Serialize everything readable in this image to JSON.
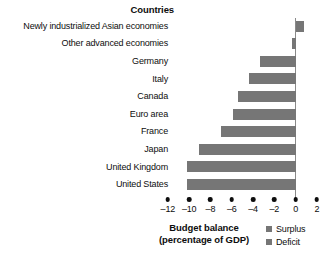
{
  "heading": "Countries",
  "axis_title_line1": "Budget balance",
  "axis_title_line2": "(percentage of GDP)",
  "legend": [
    {
      "label": "Surplus",
      "color": "#767676",
      "name": "surplus"
    },
    {
      "label": "Deficit",
      "color": "#767676",
      "name": "deficit"
    }
  ],
  "colors": {
    "bar": "#767676",
    "axis_line": "#8a8a8a",
    "text": "#0d0d0d",
    "background": "#ffffff"
  },
  "chart_data": {
    "type": "bar",
    "orientation": "horizontal",
    "title": "Countries",
    "xlabel": "Budget balance (percentage of GDP)",
    "ylabel": "Countries",
    "xlim": [
      -13,
      3
    ],
    "xticks": [
      -12,
      -10,
      -8,
      -6,
      -4,
      -2,
      0,
      2
    ],
    "xticklabels": [
      "–12",
      "–10",
      "–8",
      "–6",
      "–4",
      "–2",
      "0",
      "2"
    ],
    "grid": false,
    "legend_position": "bottom-right",
    "legend_entries": [
      "Surplus",
      "Deficit"
    ],
    "categories": [
      "Newly industrialized Asian economies",
      "Other advanced economies",
      "Germany",
      "Italy",
      "Canada",
      "Euro area",
      "France",
      "Japan",
      "United Kingdom",
      "United States"
    ],
    "values": [
      0.8,
      -0.3,
      -3.3,
      -4.4,
      -5.4,
      -5.9,
      -7.0,
      -9.1,
      -10.2,
      -10.2
    ]
  }
}
